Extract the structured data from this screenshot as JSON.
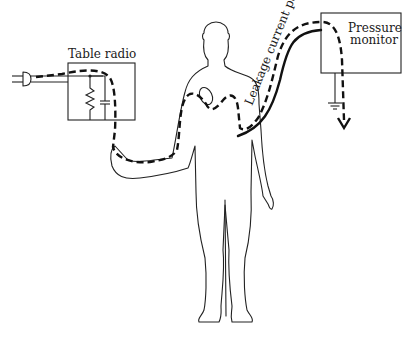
{
  "figure": {
    "type": "schematic diagram",
    "labels": {
      "table_radio": "Table radio",
      "pressure_monitor_line1": "Pressure",
      "pressure_monitor_line2": "monitor",
      "leakage_path": "Leakage current path"
    },
    "components": [
      {
        "name": "power-plug",
        "description": "two-prong plug entering from left"
      },
      {
        "name": "table-radio",
        "contains": [
          "resistor",
          "capacitor"
        ]
      },
      {
        "name": "human-figure",
        "contains": [
          "heart"
        ]
      },
      {
        "name": "pressure-monitor",
        "contains": [
          "ground"
        ]
      },
      {
        "name": "catheter-cable",
        "description": "solid line from arm to pressure monitor"
      }
    ],
    "path": {
      "style": "dashed",
      "sequence": [
        "power plug",
        "table radio",
        "hand",
        "arm",
        "heart",
        "arm",
        "catheter cable",
        "pressure monitor",
        "ground"
      ],
      "arrow_icon": "arrow-down-icon"
    },
    "colors": {
      "line": "#222222",
      "background": "#ffffff"
    }
  }
}
